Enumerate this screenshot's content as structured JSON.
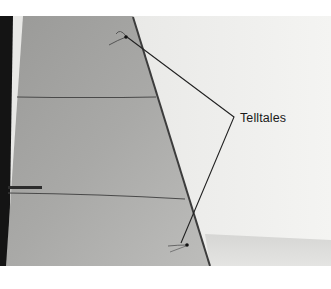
{
  "figure": {
    "type": "annotated-photograph",
    "annotation": {
      "label": "Telltales",
      "pointer_targets": [
        "upper-telltale",
        "lower-telltale"
      ]
    }
  }
}
